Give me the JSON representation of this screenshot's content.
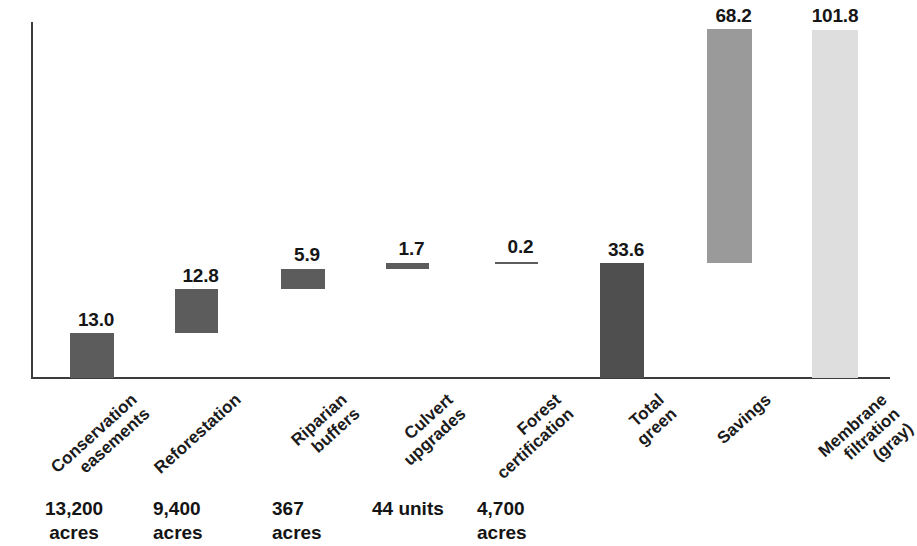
{
  "chart_data": {
    "type": "bar",
    "subtype": "waterfall",
    "title": "",
    "xlabel": "",
    "ylabel": "",
    "ylim": [
      0,
      101.8
    ],
    "grid": false,
    "legend": "none",
    "categories": [
      "Conservation easements",
      "Reforestation",
      "Riparian buffers",
      "Culvert upgrades",
      "Forest certification",
      "Total green",
      "Savings",
      "Membrane filtration (gray)"
    ],
    "values": [
      13.0,
      12.8,
      5.9,
      1.7,
      0.2,
      33.6,
      68.2,
      101.8
    ],
    "value_labels": [
      "13.0",
      "12.8",
      "5.9",
      "1.7",
      "0.2",
      "33.6",
      "68.2",
      "101.8"
    ],
    "bar_kinds": [
      "increment",
      "increment",
      "increment",
      "increment",
      "increment",
      "total",
      "increment",
      "total"
    ],
    "bases": [
      0,
      13.0,
      25.8,
      31.7,
      33.4,
      0,
      33.6,
      0
    ],
    "bar_colors": [
      "#5c5c5c",
      "#5c5c5c",
      "#5c5c5c",
      "#5c5c5c",
      "#5c5c5c",
      "#4f4f4f",
      "#9a9a9a",
      "#dedede"
    ],
    "footnotes": [
      "13,200 acres",
      "9,400 acres",
      "367 acres",
      "44 units",
      "4,700 acres",
      "",
      "",
      ""
    ],
    "axis_color": "#3c3c3c"
  },
  "bars": [
    {
      "id": "conservation-easements",
      "label_lines": [
        "Conservation",
        "easements"
      ],
      "value_label": "13.0",
      "note_lines": [
        "13,200",
        "acres"
      ],
      "color": "#5c5c5c",
      "x": 70,
      "width": 44,
      "top": 333,
      "height": 45,
      "label_x": 70,
      "label_y": 310,
      "cat_x": 128,
      "cat_y": 390,
      "note_x": 45,
      "note_y": 497
    },
    {
      "id": "reforestation",
      "label_lines": [
        "Reforestation"
      ],
      "value_label": "12.8",
      "note_lines": [
        "9,400",
        "acres"
      ],
      "color": "#5c5c5c",
      "x": 175,
      "width": 43,
      "top": 289,
      "height": 44,
      "label_x": 175,
      "label_y": 266,
      "cat_x": 232,
      "cat_y": 390,
      "note_x": 153,
      "note_y": 497
    },
    {
      "id": "riparian-buffers",
      "label_lines": [
        "Riparian",
        "buffers"
      ],
      "value_label": "5.9",
      "note_lines": [
        "367",
        "acres"
      ],
      "color": "#5c5c5c",
      "x": 281,
      "width": 44,
      "top": 269,
      "height": 20,
      "label_x": 281,
      "label_y": 245,
      "cat_x": 338,
      "cat_y": 390,
      "note_x": 272,
      "note_y": 497
    },
    {
      "id": "culvert-upgrades",
      "label_lines": [
        "Culvert",
        "upgrades"
      ],
      "value_label": "1.7",
      "note_lines": [
        "44 units"
      ],
      "color": "#5c5c5c",
      "x": 386,
      "width": 43,
      "top": 263,
      "height": 6,
      "label_x": 386,
      "label_y": 239,
      "cat_x": 444,
      "cat_y": 390,
      "note_x": 372,
      "note_y": 497
    },
    {
      "id": "forest-certification",
      "label_lines": [
        "Forest",
        "certification"
      ],
      "value_label": "0.2",
      "note_lines": [
        "4,700",
        "acres"
      ],
      "color": "#5c5c5c",
      "x": 495,
      "width": 43,
      "top": 262,
      "height": 2,
      "label_x": 495,
      "label_y": 237,
      "cat_x": 552,
      "cat_y": 390,
      "note_x": 477,
      "note_y": 497
    },
    {
      "id": "total-green",
      "label_lines": [
        "Total",
        "green"
      ],
      "value_label": "33.6",
      "note_lines": [],
      "color": "#4f4f4f",
      "x": 600,
      "width": 44,
      "top": 263,
      "height": 115,
      "label_x": 600,
      "label_y": 240,
      "cat_x": 655,
      "cat_y": 390,
      "note_x": 0,
      "note_y": 0
    },
    {
      "id": "savings",
      "label_lines": [
        "Savings"
      ],
      "value_label": "68.2",
      "note_lines": [],
      "color": "#9a9a9a",
      "x": 707,
      "width": 45,
      "top": 29,
      "height": 234,
      "label_x": 707,
      "label_y": 6,
      "cat_x": 762,
      "cat_y": 390,
      "note_x": 0,
      "note_y": 0
    },
    {
      "id": "membrane-filtration",
      "label_lines": [
        "Membrane",
        "filtration",
        "(gray)"
      ],
      "value_label": "101.8",
      "note_lines": [],
      "color": "#dedede",
      "x": 812,
      "width": 46,
      "top": 30,
      "height": 348,
      "label_x": 808,
      "label_y": 6,
      "cat_x": 878,
      "cat_y": 390,
      "note_x": 0,
      "note_y": 0
    }
  ]
}
